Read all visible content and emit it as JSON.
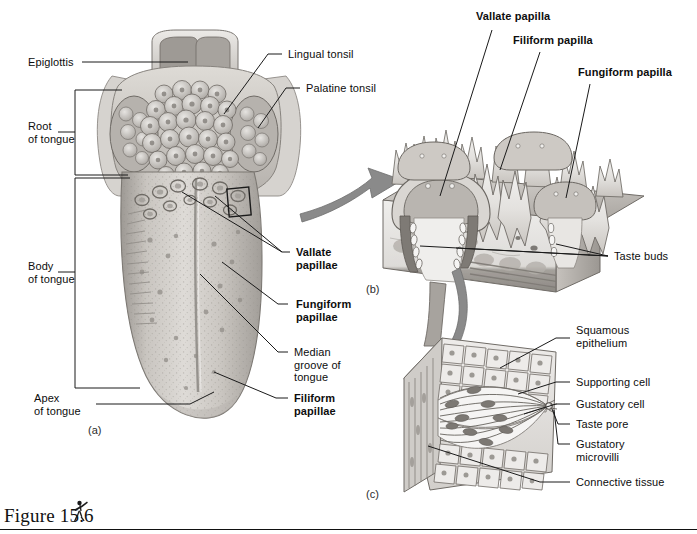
{
  "figure": {
    "caption": "Figure 15.6",
    "icon_name": "human-figure-icon"
  },
  "panels": [
    {
      "id": "a",
      "label": "(a)",
      "name": "panel-a-tongue-surface"
    },
    {
      "id": "b",
      "label": "(b)",
      "name": "panel-b-papillae-section"
    },
    {
      "id": "c",
      "label": "(c)",
      "name": "panel-c-taste-bud"
    }
  ],
  "panel_a": {
    "labels": {
      "epiglottis": "Epiglottis",
      "root_of_tongue": "Root\nof tongue",
      "body_of_tongue": "Body\nof tongue",
      "apex_of_tongue": "Apex\nof tongue",
      "lingual_tonsil": "Lingual tonsil",
      "palatine_tonsil": "Palatine tonsil",
      "vallate_papillae": "Vallate\npapillae",
      "fungiform_papillae": "Fungiform\npapillae",
      "median_groove": "Median\ngroove of\ntongue",
      "filiform_papillae": "Filiform\npapillae"
    }
  },
  "panel_b": {
    "labels": {
      "vallate_papilla": "Vallate papilla",
      "filiform_papilla": "Filiform papilla",
      "fungiform_papilla": "Fungiform papilla",
      "taste_buds": "Taste buds"
    }
  },
  "panel_c": {
    "labels": {
      "squamous_epithelium": "Squamous\nepithelium",
      "supporting_cell": "Supporting cell",
      "gustatory_cell": "Gustatory cell",
      "taste_pore": "Taste pore",
      "gustatory_microvilli": "Gustatory\nmicrovilli",
      "connective_tissue": "Connective tissue"
    }
  },
  "colors": {
    "ink": "#111111",
    "leader": "#1a1a1a",
    "arrow": "#8a8a8a",
    "tissue_light": "#e4e2df",
    "tissue_mid": "#b9b5b0",
    "tissue_dark": "#8e8a85",
    "background": "#ffffff"
  }
}
